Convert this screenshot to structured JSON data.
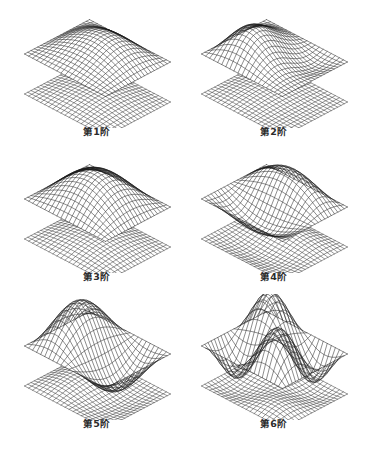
{
  "figure": {
    "title": "",
    "background_color": "#ffffff",
    "line_color": "#1a1a1a",
    "caption_color": "#2b2b2b",
    "columns": 2,
    "rows": 3
  },
  "chart_data": {
    "type": "surface",
    "projection": "isometric",
    "grid_cells_u": 20,
    "grid_cells_v": 20,
    "xlabel": "",
    "ylabel": "",
    "zlabel": "",
    "panels": [
      {
        "index": 1,
        "caption": "第1阶",
        "mode_name": "first bending",
        "upper": {
          "amplitude": 0.62,
          "terms": [
            {
              "m": 1,
              "n": 1,
              "a": 1.0
            },
            {
              "m": 1,
              "n": 2,
              "a": 0.18
            }
          ]
        },
        "lower": {
          "amplitude": 0.2,
          "terms": [
            {
              "m": 1,
              "n": 1,
              "a": 1.0
            }
          ]
        }
      },
      {
        "index": 2,
        "caption": "第2阶",
        "mode_name": "first torsion / diagonal ridge",
        "upper": {
          "amplitude": 0.68,
          "terms": [
            {
              "m": 1,
              "n": 1,
              "a": 0.85
            },
            {
              "m": 2,
              "n": 1,
              "a": 0.55
            },
            {
              "m": 1,
              "n": 2,
              "a": -0.35
            }
          ]
        },
        "lower": {
          "amplitude": 0.16,
          "terms": [
            {
              "m": 1,
              "n": 1,
              "a": 0.6
            },
            {
              "m": 2,
              "n": 1,
              "a": 0.3
            }
          ]
        }
      },
      {
        "index": 3,
        "caption": "第3阶",
        "mode_name": "central dome",
        "upper": {
          "amplitude": 1.02,
          "terms": [
            {
              "m": 1,
              "n": 1,
              "a": 1.0
            }
          ]
        },
        "lower": {
          "amplitude": 0.26,
          "terms": [
            {
              "m": 1,
              "n": 1,
              "a": 1.0
            }
          ]
        }
      },
      {
        "index": 4,
        "caption": "第4阶",
        "mode_name": "saddle with central ridge",
        "upper": {
          "amplitude": 0.72,
          "terms": [
            {
              "m": 1,
              "n": 2,
              "a": 1.0
            },
            {
              "m": 1,
              "n": 1,
              "a": 0.25
            }
          ]
        },
        "lower": {
          "amplitude": 0.2,
          "terms": [
            {
              "m": 1,
              "n": 2,
              "a": 0.8
            },
            {
              "m": 1,
              "n": 1,
              "a": 0.2
            }
          ]
        }
      },
      {
        "index": 5,
        "caption": "第5阶",
        "mode_name": "two peaks with valley",
        "upper": {
          "amplitude": 1.1,
          "terms": [
            {
              "m": 2,
              "n": 1,
              "a": 1.0
            },
            {
              "m": 1,
              "n": 1,
              "a": 0.22
            }
          ]
        },
        "lower": {
          "amplitude": 0.24,
          "terms": [
            {
              "m": 2,
              "n": 1,
              "a": 0.7
            },
            {
              "m": 1,
              "n": 1,
              "a": 0.25
            }
          ]
        }
      },
      {
        "index": 6,
        "caption": "第6阶",
        "mode_name": "peak with adjacent dip",
        "upper": {
          "amplitude": 1.15,
          "terms": [
            {
              "m": 2,
              "n": 2,
              "a": 1.0
            },
            {
              "m": 1,
              "n": 1,
              "a": 0.3
            }
          ]
        },
        "lower": {
          "amplitude": 0.22,
          "terms": [
            {
              "m": 2,
              "n": 2,
              "a": 0.65
            },
            {
              "m": 1,
              "n": 1,
              "a": 0.3
            }
          ]
        }
      }
    ]
  }
}
